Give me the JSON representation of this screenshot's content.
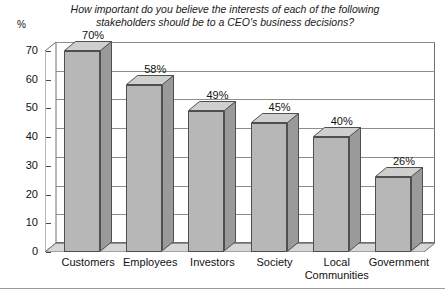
{
  "chart_data": {
    "type": "bar",
    "title": "How important do you believe the interests of each of the following stakeholders should be to a CEO's business decisions?",
    "title_line1": "How important do you believe the interests of each of the following",
    "title_line2": "stakeholders should be to a CEO's business decisions?",
    "categories": [
      "Customers",
      "Employees",
      "Investors",
      "Society",
      "Local Communities",
      "Government"
    ],
    "category_lines": [
      [
        "Customers"
      ],
      [
        "Employees"
      ],
      [
        "Investors"
      ],
      [
        "Society"
      ],
      [
        "Local",
        "Communities"
      ],
      [
        "Government"
      ]
    ],
    "values": [
      70,
      58,
      49,
      45,
      40,
      26
    ],
    "value_labels": [
      "70%",
      "58%",
      "49%",
      "45%",
      "40%",
      "26%"
    ],
    "xlabel": "",
    "ylabel": "%",
    "ylim": [
      0,
      70
    ],
    "ytick_labels": [
      "70",
      "60",
      "50",
      "40",
      "30",
      "20",
      "10",
      "0"
    ],
    "ytick_values": [
      70,
      60,
      50,
      40,
      30,
      20,
      10,
      0
    ],
    "grid": true,
    "legend": false,
    "style": "3d-column",
    "colors": {
      "bar_front": "#b7b7b7",
      "bar_top": "#cfcfcf",
      "bar_side": "#9a9a9a",
      "bar_outline": "#4f4f4f",
      "gridline": "#8d8d8d",
      "axis": "#4a4a4a",
      "background": "#ffffff",
      "text": "#111111"
    }
  }
}
